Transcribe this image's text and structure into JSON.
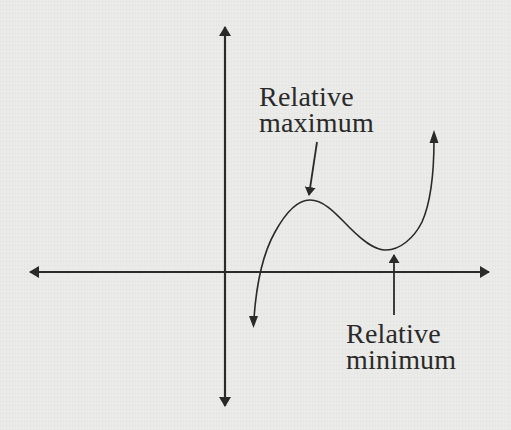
{
  "diagram": {
    "title": "",
    "type": "function-graph",
    "background_color": "#ebebe9",
    "ink_color": "#2a2a2a",
    "axes": {
      "x_axis": {
        "y": 272,
        "x_start": 28,
        "x_end": 490,
        "arrows": "both"
      },
      "y_axis": {
        "x": 225,
        "y_start": 26,
        "y_end": 407,
        "arrows": "both"
      }
    },
    "curve": {
      "description": "cubic-like curve with one relative maximum and one relative minimum, arrows at both ends",
      "start_arrow": [
        253,
        326
      ],
      "end_arrow": [
        434,
        131
      ],
      "relative_max_point": [
        310,
        200
      ],
      "relative_min_point": [
        386,
        250
      ]
    },
    "annotations": {
      "max": {
        "line1": "Relative",
        "line2": "maximum",
        "pointer_from": [
          317,
          142
        ],
        "pointer_to": [
          308,
          196
        ]
      },
      "min": {
        "line1": "Relative",
        "line2": "minimum",
        "pointer_from": [
          394,
          315
        ],
        "pointer_to": [
          394,
          254
        ]
      }
    }
  }
}
